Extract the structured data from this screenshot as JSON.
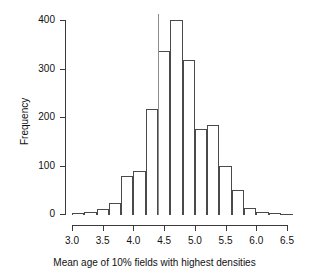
{
  "chart_data": {
    "type": "bar",
    "title": "",
    "xlabel": "Mean age of 10% fields with highest densities",
    "ylabel": "Frequency",
    "xlim": [
      3.0,
      6.6
    ],
    "ylim": [
      0,
      400
    ],
    "bin_width": 0.2,
    "grid": false,
    "legend": null,
    "x_ticks": [
      3.0,
      3.5,
      4.0,
      4.5,
      5.0,
      5.5,
      6.0,
      6.5
    ],
    "x_tick_labels": [
      "3.0",
      "3.5",
      "4.0",
      "4.5",
      "5.0",
      "5.5",
      "6.0",
      "6.5"
    ],
    "y_ticks": [
      0,
      100,
      200,
      300,
      400
    ],
    "y_tick_labels": [
      "0",
      "100",
      "200",
      "300",
      "400"
    ],
    "bin_edges": [
      3.0,
      3.2,
      3.4,
      3.6,
      3.8,
      4.0,
      4.2,
      4.4,
      4.6,
      4.8,
      5.0,
      5.2,
      5.4,
      5.6,
      5.8,
      6.0,
      6.2,
      6.4,
      6.6
    ],
    "categories": [
      "3.0-3.2",
      "3.2-3.4",
      "3.4-3.6",
      "3.6-3.8",
      "3.8-4.0",
      "4.0-4.2",
      "4.2-4.4",
      "4.4-4.6",
      "4.6-4.8",
      "4.8-5.0",
      "5.0-5.2",
      "5.2-5.4",
      "5.4-5.6",
      "5.6-5.8",
      "5.8-6.0",
      "6.0-6.2",
      "6.2-6.4",
      "6.4-6.6"
    ],
    "values": [
      2,
      5,
      10,
      22,
      79,
      89,
      216,
      337,
      400,
      318,
      175,
      183,
      100,
      50,
      12,
      4,
      2,
      1
    ],
    "annotations": [
      {
        "type": "vertical-reference-line",
        "x": 4.4,
        "color": "#8d8d8d"
      }
    ]
  },
  "colors": {
    "bar_stroke": "#4a4a4a",
    "bar_fill": "transparent",
    "axis": "#3a3a3a",
    "text": "#111111",
    "reference_line": "#8d8d8d",
    "background": "#ffffff"
  }
}
